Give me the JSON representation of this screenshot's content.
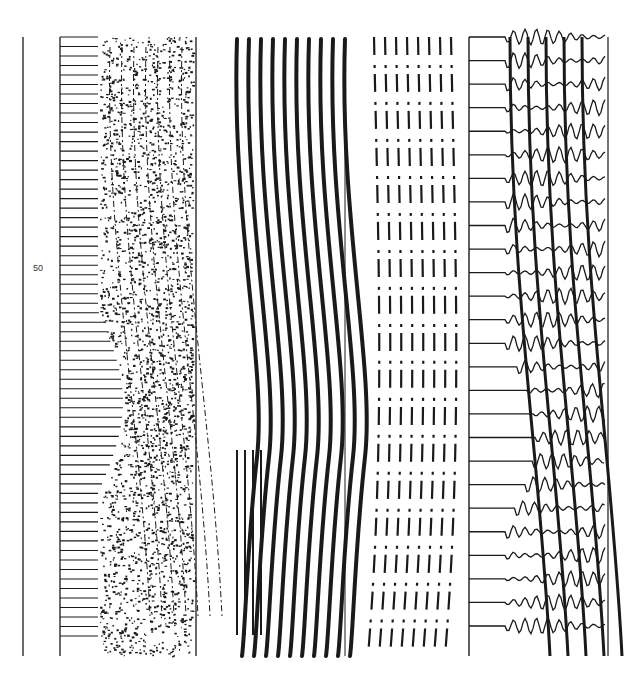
{
  "figure": {
    "axis_label": "50",
    "ink_color": "#1a1a1a",
    "background": "#ffffff",
    "panels": [
      {
        "id": "panel-1",
        "type": "comb-with-scattered-waves",
        "x0": 60,
        "x1": 196,
        "teeth": 50,
        "teeth_end": 98
      },
      {
        "id": "panel-2",
        "type": "thick-curved-stripes",
        "x0": 228,
        "x1": 345
      },
      {
        "id": "panel-3",
        "type": "dotted-stripes",
        "x0": 370,
        "x1": 469
      },
      {
        "id": "panel-4",
        "type": "comb-with-oscillating-waves",
        "x0": 469,
        "x1": 608,
        "teeth": 26,
        "teeth_end": 505
      }
    ],
    "y_top": 37,
    "y_bottom": 656,
    "axis_x": 23
  }
}
